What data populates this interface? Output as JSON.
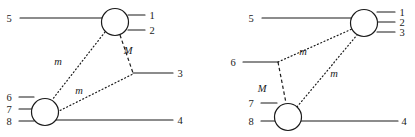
{
  "figure": {
    "background_color": "#ffffff",
    "line_color": "#1a1a1a",
    "width": 415,
    "height": 137,
    "diagrams": [
      {
        "id": "left-diagram",
        "name": "left-feynman-diagram",
        "blobs": [
          {
            "name": "upper-vertex-blob",
            "cx": 115,
            "cy": 22,
            "r": 13.5
          },
          {
            "name": "lower-vertex-blob",
            "cx": 45,
            "cy": 112,
            "r": 13.5
          }
        ],
        "external_lines": [
          {
            "name": "leg-5",
            "label": "5",
            "label_x": 9,
            "label_y": 22,
            "x1": 20,
            "y1": 18,
            "x2": 102,
            "y2": 18
          },
          {
            "name": "leg-1",
            "label": "1",
            "label_x": 152,
            "label_y": 19,
            "x1": 128,
            "y1": 15,
            "x2": 145,
            "y2": 15
          },
          {
            "name": "leg-2",
            "label": "2",
            "label_x": 152,
            "label_y": 34,
            "x1": 128,
            "y1": 30,
            "x2": 145,
            "y2": 30
          },
          {
            "name": "leg-3",
            "label": "3",
            "label_x": 180,
            "label_y": 77,
            "x1": 133,
            "y1": 73,
            "x2": 173,
            "y2": 73
          },
          {
            "name": "leg-6",
            "label": "6",
            "label_x": 9,
            "label_y": 101,
            "x1": 19,
            "y1": 97,
            "x2": 34,
            "y2": 97
          },
          {
            "name": "leg-7",
            "label": "7",
            "label_x": 9,
            "label_y": 113,
            "x1": 19,
            "y1": 109,
            "x2": 33,
            "y2": 109
          },
          {
            "name": "leg-8",
            "label": "8",
            "label_x": 9,
            "label_y": 125,
            "x1": 19,
            "y1": 121,
            "x2": 34,
            "y2": 121
          },
          {
            "name": "leg-4",
            "label": "4",
            "label_x": 180,
            "label_y": 124,
            "x1": 56,
            "y1": 120,
            "x2": 173,
            "y2": 120
          }
        ],
        "propagators": [
          {
            "name": "propagator-m-upper-left",
            "style": "dotted",
            "x1": 105,
            "y1": 32,
            "x2": 52,
            "y2": 100
          },
          {
            "name": "propagator-M",
            "style": "dashed",
            "x1": 120,
            "y1": 35,
            "x2": 133,
            "y2": 73
          },
          {
            "name": "propagator-m-lower",
            "style": "dotted",
            "x1": 57,
            "y1": 112,
            "x2": 133,
            "y2": 74
          }
        ],
        "mass_labels": [
          {
            "name": "mass-label-m-upper",
            "text": "m",
            "x": 58,
            "y": 65
          },
          {
            "name": "mass-label-M",
            "text": "M",
            "x": 128,
            "y": 54
          },
          {
            "name": "mass-label-m-lower",
            "text": "m",
            "x": 79,
            "y": 94
          }
        ]
      },
      {
        "id": "right-diagram",
        "name": "right-feynman-diagram",
        "blobs": [
          {
            "name": "right-vertex-blob",
            "cx": 364,
            "cy": 23,
            "r": 13.5
          },
          {
            "name": "lower-vertex-blob",
            "cx": 288,
            "cy": 117,
            "r": 13.5
          }
        ],
        "external_lines": [
          {
            "name": "leg-5",
            "label": "5",
            "label_x": 251,
            "label_y": 22,
            "x1": 262,
            "y1": 18,
            "x2": 351,
            "y2": 18
          },
          {
            "name": "leg-1",
            "label": "1",
            "label_x": 402,
            "label_y": 16,
            "x1": 377,
            "y1": 12,
            "x2": 395,
            "y2": 12
          },
          {
            "name": "leg-2",
            "label": "2",
            "label_x": 402,
            "label_y": 26,
            "x1": 378,
            "y1": 22,
            "x2": 395,
            "y2": 22
          },
          {
            "name": "leg-3",
            "label": "3",
            "label_x": 402,
            "label_y": 36,
            "x1": 377,
            "y1": 32,
            "x2": 395,
            "y2": 32
          },
          {
            "name": "leg-6",
            "label": "6",
            "label_x": 233,
            "label_y": 66,
            "x1": 243,
            "y1": 62,
            "x2": 278,
            "y2": 62
          },
          {
            "name": "leg-7",
            "label": "7",
            "label_x": 251,
            "label_y": 107,
            "x1": 261,
            "y1": 103,
            "x2": 277,
            "y2": 103
          },
          {
            "name": "leg-8",
            "label": "8",
            "label_x": 251,
            "label_y": 125,
            "x1": 261,
            "y1": 121,
            "x2": 277,
            "y2": 121
          },
          {
            "name": "leg-4",
            "label": "4",
            "label_x": 404,
            "label_y": 125,
            "x1": 299,
            "y1": 121,
            "x2": 398,
            "y2": 121
          }
        ],
        "propagators": [
          {
            "name": "propagator-m-upper",
            "style": "dotted",
            "x1": 278,
            "y1": 62,
            "x2": 352,
            "y2": 29
          },
          {
            "name": "propagator-M",
            "style": "dashed",
            "x1": 278,
            "y1": 62,
            "x2": 286,
            "y2": 103
          },
          {
            "name": "propagator-m-lower",
            "style": "dotted",
            "x1": 297,
            "y1": 107,
            "x2": 357,
            "y2": 35
          }
        ],
        "mass_labels": [
          {
            "name": "mass-label-m-upper",
            "text": "m",
            "x": 303,
            "y": 55
          },
          {
            "name": "mass-label-M",
            "text": "M",
            "x": 262,
            "y": 92
          },
          {
            "name": "mass-label-m-lower",
            "text": "m",
            "x": 334,
            "y": 77
          }
        ]
      }
    ]
  }
}
